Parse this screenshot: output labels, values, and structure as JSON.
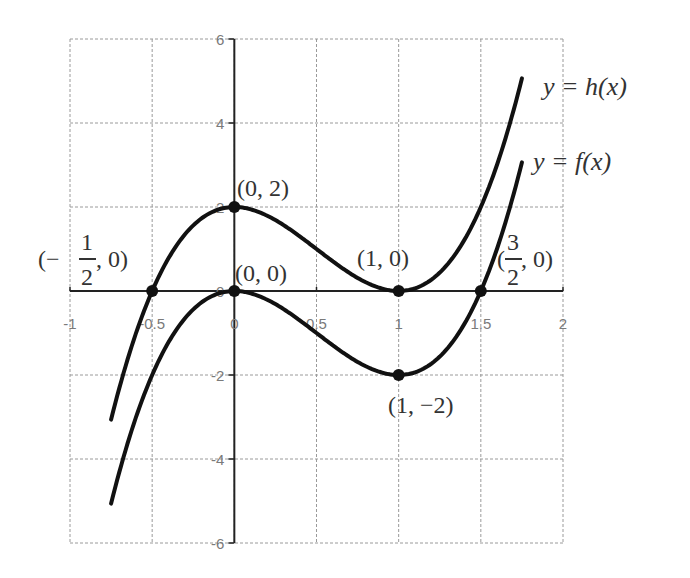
{
  "chart_data": {
    "type": "line",
    "title": "",
    "xlabel": "",
    "ylabel": "",
    "xlim": [
      -1,
      2
    ],
    "ylim": [
      -6,
      6
    ],
    "grid": true,
    "x_ticks": [
      -1,
      -0.5,
      0,
      0.5,
      1,
      1.5,
      2
    ],
    "x_tick_labels": [
      "-1",
      "-0.5",
      "0",
      "0.5",
      "1",
      "1.5",
      "2"
    ],
    "y_ticks": [
      -6,
      -4,
      -2,
      0,
      2,
      4,
      6
    ],
    "y_tick_labels": [
      "-6",
      "-4",
      "-2",
      "0",
      "2",
      "4",
      "6"
    ],
    "series": [
      {
        "name": "y = h(x)",
        "formula": "h(x) = 4x^3 - 6x^2 + 2",
        "x_range": [
          -0.75,
          1.75
        ],
        "x": [
          -0.75,
          -0.5,
          0,
          0.5,
          1,
          1.5,
          1.75
        ],
        "y": [
          -3.06,
          0,
          2,
          1,
          0,
          2,
          5.06
        ]
      },
      {
        "name": "y = f(x)",
        "formula": "f(x) = 4x^3 - 6x^2",
        "x_range": [
          -0.75,
          1.75
        ],
        "x": [
          -0.75,
          -0.5,
          0,
          0.5,
          1,
          1.5,
          1.75
        ],
        "y": [
          -5.06,
          -2,
          0,
          -1,
          -2,
          0,
          3.06
        ]
      }
    ],
    "points": [
      {
        "x": 0,
        "y": 2,
        "label": "(0,2)"
      },
      {
        "x": 0,
        "y": 0,
        "label": "(0,0)"
      },
      {
        "x": -0.5,
        "y": 0,
        "label": "(-1/2,0)"
      },
      {
        "x": 1,
        "y": 0,
        "label": "(1,0)"
      },
      {
        "x": 1,
        "y": -2,
        "label": "(1,−2)"
      },
      {
        "x": 1.5,
        "y": 0,
        "label": "(3/2,0)"
      }
    ],
    "legend": {
      "position": "right-of-curves",
      "entries": [
        "y = h(x)",
        "y = f(x)"
      ]
    }
  },
  "labels": {
    "h_curve": "y = h(x)",
    "f_curve": "y = f(x)",
    "pt_0_2": "(0, 2)",
    "pt_0_0": "(0, 0)",
    "pt_1_0": "(1, 0)",
    "pt_1_m2": "(1, −2)",
    "pt_mhalf_open": "(−",
    "pt_mhalf_num": "1",
    "pt_mhalf_den": "2",
    "pt_mhalf_close": ", 0)",
    "pt_3half_open": "(",
    "pt_3half_num": "3",
    "pt_3half_den": "2",
    "pt_3half_close": ", 0)"
  },
  "style": {
    "curve_color": "#111111",
    "grid_color": "#9a9a9a",
    "axis_color": "#222222",
    "tick_color": "#7a7a7a"
  }
}
